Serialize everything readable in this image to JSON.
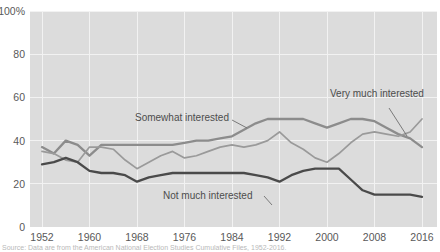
{
  "chart_data": {
    "type": "line",
    "title": "",
    "subtitle": "",
    "xlabel": "",
    "ylabel": "",
    "xlim": [
      1952,
      2016
    ],
    "ylim": [
      0,
      100
    ],
    "grid": true,
    "legend_position": "inline-labels",
    "y_ticks": [
      "0",
      "20",
      "40",
      "60",
      "80",
      "100%"
    ],
    "y_tick_values": [
      0,
      20,
      40,
      60,
      80,
      100
    ],
    "x_ticks": [
      "1952",
      "1960",
      "1968",
      "1976",
      "1984",
      "1992",
      "2000",
      "2008",
      "2016"
    ],
    "x_tick_values": [
      1952,
      1960,
      1968,
      1976,
      1984,
      1992,
      2000,
      2008,
      2016
    ],
    "x": [
      1952,
      1954,
      1956,
      1958,
      1960,
      1962,
      1964,
      1966,
      1968,
      1970,
      1972,
      1974,
      1976,
      1978,
      1980,
      1982,
      1984,
      1986,
      1988,
      1990,
      1992,
      1994,
      1996,
      1998,
      2000,
      2002,
      2004,
      2006,
      2008,
      2010,
      2012,
      2014,
      2016
    ],
    "series": [
      {
        "name": "Somewhat interested",
        "color": "#8c8c8c",
        "values": [
          37,
          34,
          40,
          38,
          33,
          38,
          38,
          38,
          38,
          38,
          38,
          38,
          39,
          40,
          40,
          41,
          42,
          45,
          48,
          50,
          50,
          50,
          50,
          48,
          46,
          48,
          50,
          50,
          49,
          46,
          43,
          41,
          37
        ]
      },
      {
        "name": "Very much interested",
        "color": "#9a9a9a",
        "values": [
          35,
          34,
          31,
          30,
          37,
          37,
          36,
          31,
          27,
          30,
          33,
          35,
          32,
          33,
          35,
          37,
          38,
          37,
          38,
          40,
          44,
          39,
          36,
          32,
          30,
          34,
          39,
          43,
          44,
          43,
          42,
          44,
          50
        ]
      },
      {
        "name": "Not much interested",
        "color": "#4a4a4a",
        "values": [
          29,
          30,
          32,
          30,
          26,
          25,
          25,
          24,
          21,
          23,
          24,
          25,
          25,
          25,
          25,
          25,
          25,
          25,
          24,
          23,
          21,
          24,
          26,
          27,
          27,
          27,
          22,
          17,
          15,
          15,
          15,
          15,
          14
        ]
      }
    ],
    "annotations": [
      {
        "text": "Somewhat interested",
        "x": 1976,
        "y": 53
      },
      {
        "text": "Very much interested",
        "x": 2009,
        "y": 59
      },
      {
        "text": "Not much interested",
        "x": 1988,
        "y": 16
      }
    ]
  },
  "source": {
    "note": "Source: Data are from the American National Election Studies Cumulative Files, 1952-2016."
  }
}
